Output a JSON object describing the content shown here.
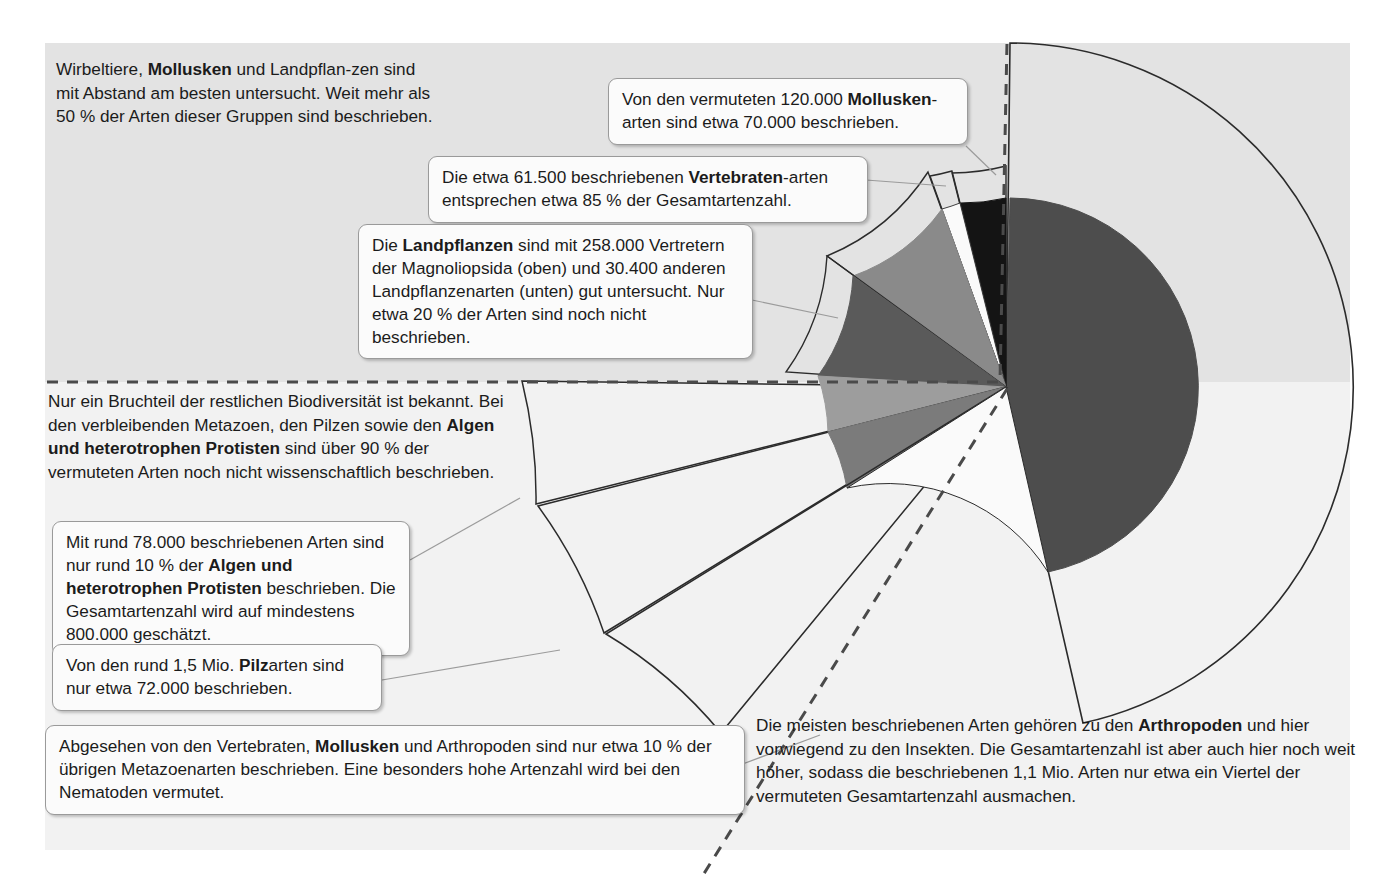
{
  "figure": {
    "background_gray": "#e3e3e3",
    "background_light": "#f2f2f2"
  },
  "texts": {
    "intro_top": "Wirbeltiere, Mollusken und Landpflan-zen sind mit Abstand am besten untersucht. Weit mehr als 50 % der Arten dieser Gruppen sind beschrieben.",
    "intro_mid": "Nur ein Bruchteil der restlichen Biodiversität ist bekannt. Bei den verbleibenden Metazoen, den Pilzen sowie den Algen und heterotrophen Protisten sind über 90 % der vermuteten Arten noch nicht wissenschaftlich beschrieben.",
    "arthropoden": "Die meisten beschriebenen Arten gehören zu den Arthropoden und hier vorwiegend zu den Insekten. Die Gesamtartenzahl ist aber auch hier noch weit höher, sodass die beschriebenen 1,1 Mio. Arten nur etwa ein Viertel der vermuteten Gesamtartenzahl ausmachen."
  },
  "callouts": {
    "mollusken": "Von den vermuteten 120.000 Mollusken-arten sind etwa 70.000 beschrieben.",
    "vertebraten": "Die etwa 61.500 beschriebenen Vertebraten-arten entsprechen etwa 85 % der Gesamtartenzahl.",
    "landpflanzen": "Die Landpflanzen sind mit 258.000 Vertretern der Magnoliopsida (oben) und 30.400 anderen Landpflanzenarten (unten) gut untersucht. Nur etwa 20 % der Arten sind noch nicht beschrieben.",
    "algen": "Mit rund 78.000 beschriebenen Arten sind nur rund 10 % der Algen und heterotrophen Protisten beschrieben. Die Gesamtartenzahl wird auf mindestens 800.000 geschätzt.",
    "pilze": "Von den rund 1,5 Mio. Pilzarten sind nur etwa 72.000 beschrieben.",
    "metazoen": "Abgesehen von den Vertebraten, Mollusken und Arthropoden sind nur etwa 10 % der übrigen Metazoenarten beschrieben. Eine besonders hohe Artenzahl wird bei den Nematoden vermutet."
  },
  "chart_data": {
    "type": "pie",
    "units": "Arten",
    "center": {
      "x": 1006,
      "y": 387
    },
    "described_radius_px": 189,
    "estimated_radius_px": 344,
    "note": "Innerer ausgefüllter Radius = beschriebene Arten; dünn umrandete Ausdehnung = vermutete Gesamtartenzahl. Segmentwinkel proportional zu beschriebenen Arten.",
    "legend_position": "none",
    "categories": [
      "Arthropoden",
      "Mollusken",
      "Vertebraten",
      "Landpflanzen (Magnoliopsida)",
      "andere Landpflanzen",
      "Algen und heterotrophe Protisten",
      "Pilze",
      "übrige Metazoen"
    ],
    "series": [
      {
        "name": "beschriebene Arten",
        "values": [
          1100000,
          70000,
          61500,
          258000,
          30400,
          78000,
          72000,
          130000
        ]
      },
      {
        "name": "vermutete Gesamtartenzahl",
        "values": [
          4400000,
          120000,
          72000,
          322500,
          38000,
          800000,
          1500000,
          1300000
        ]
      }
    ],
    "percent_described": {
      "Arthropoden": 25,
      "Mollusken": 58,
      "Vertebraten": 85,
      "Landpflanzen": 80,
      "Algen und heterotrophe Protisten": 10,
      "Pilze": 5,
      "übrige Metazoen": 10
    },
    "colors": {
      "arthropoden": "#4d4d4d",
      "mollusken": "#141414",
      "vertebraten": "#fafafa",
      "magnoliopsida": "#8a8a8a",
      "andere_landpflanzen": "#5a5a5a",
      "algen": "#9d9d9d",
      "pilze": "#7b7b7b",
      "uebrige_metazoen": "#fafafa",
      "outline": "#2b2b2b"
    }
  }
}
